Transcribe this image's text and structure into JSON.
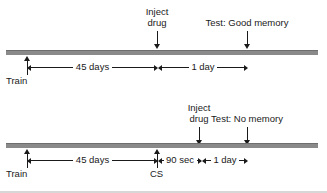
{
  "figure": {
    "title": "",
    "colors": {
      "axis_bar": "#8a8a8a",
      "axis_bar_top": "#6e6e6e",
      "ink": "#1a1a1a",
      "footer_rule": "#d7d7d7"
    }
  },
  "timelines": [
    {
      "id": "timeline-good-memory",
      "outcome": "Good memory",
      "events": [
        {
          "name": "inject-drug",
          "label": "Inject\ndrug"
        },
        {
          "name": "test",
          "label": "Test: Good memory"
        }
      ],
      "markers": [
        {
          "name": "train",
          "label": "Train"
        }
      ],
      "intervals": [
        {
          "name": "interval-45-days",
          "label": "45 days"
        },
        {
          "name": "interval-1-day",
          "label": "1 day"
        }
      ]
    },
    {
      "id": "timeline-no-memory",
      "outcome": "No memory",
      "events": [
        {
          "name": "inject-drug",
          "label": "Inject\ndrug"
        },
        {
          "name": "test",
          "label": "Test: No memory"
        }
      ],
      "markers": [
        {
          "name": "train",
          "label": "Train"
        },
        {
          "name": "cs",
          "label": "CS"
        }
      ],
      "intervals": [
        {
          "name": "interval-45-days",
          "label": "45 days"
        },
        {
          "name": "interval-90-sec",
          "label": "90 sec"
        },
        {
          "name": "interval-1-day",
          "label": "1 day"
        }
      ]
    }
  ]
}
